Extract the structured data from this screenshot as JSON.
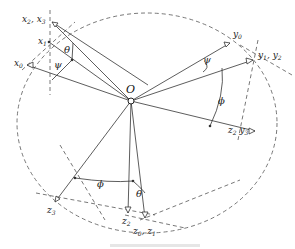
{
  "diagram": {
    "origin_label": "O",
    "axes": {
      "x_top_pair": {
        "main": "x",
        "sub1": "2",
        "sep": ", ",
        "main2": "x",
        "sub2": "3"
      },
      "x1": {
        "main": "x",
        "sub": "1"
      },
      "x0": {
        "main": "x",
        "sub": "0"
      },
      "y0": {
        "main": "y",
        "sub": "0"
      },
      "y1_y2": {
        "main": "y",
        "sub1": "1",
        "sep": ", ",
        "main2": "y",
        "sub2": "2"
      },
      "z2_y3": {
        "main": "z",
        "sub1": "2",
        "sep": " ",
        "main2": "y",
        "sub2": "3"
      },
      "z3": {
        "main": "z",
        "sub": "3"
      },
      "z2": {
        "main": "z",
        "sub": "2"
      },
      "z0_z1": {
        "main": "z",
        "sub1": "0",
        "sep": ", ",
        "main2": "z",
        "sub2": "1"
      }
    },
    "angles": {
      "theta_top": "θ",
      "psi_top": "ψ",
      "psi_right": "ψ",
      "phi_right": "ϕ",
      "phi_bottom": "ϕ",
      "theta_bottom": "θ"
    },
    "colors": {
      "line": "#333333",
      "dashed": "#555555",
      "background": "#ffffff"
    }
  }
}
